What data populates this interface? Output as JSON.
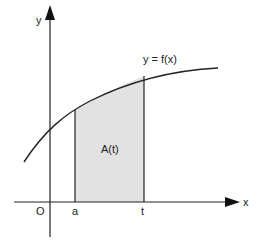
{
  "diagram": {
    "axes": {
      "x_label": "x",
      "y_label": "y",
      "origin_label": "O"
    },
    "curve_label": "y = f(x)",
    "area_label": "A(t)",
    "markers": [
      {
        "label": "a"
      },
      {
        "label": "t"
      }
    ],
    "colors": {
      "line": "#222222",
      "shade": "#e2e2e2"
    }
  }
}
